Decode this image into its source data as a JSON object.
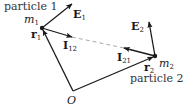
{
  "diagram": {
    "origin": {
      "label": "O",
      "x": 73,
      "y": 91
    },
    "particle1": {
      "caption": "particle 1",
      "mass": {
        "base": "m",
        "sub": "1"
      },
      "position": {
        "base": "r",
        "sub": "1"
      },
      "x": 42,
      "y": 28
    },
    "particle2": {
      "caption": "particle 2",
      "mass": {
        "base": "m",
        "sub": "2"
      },
      "position": {
        "base": "r",
        "sub": "2"
      },
      "x": 155,
      "y": 56
    },
    "fields": {
      "E1": {
        "base": "E",
        "sub": "1",
        "tip": [
          72,
          4
        ]
      },
      "E2": {
        "base": "E",
        "sub": "2",
        "tip": [
          149,
          22
        ]
      }
    },
    "interactions": {
      "I12": {
        "base": "I",
        "sub": "12",
        "tip": [
          72,
          37
        ]
      },
      "I21": {
        "base": "I",
        "sub": "21",
        "tip": [
          124,
          48
        ]
      }
    },
    "colors": {
      "ink": "#1a1a1a",
      "dashed": "#aaaaaa",
      "background": "#ffffff"
    }
  }
}
